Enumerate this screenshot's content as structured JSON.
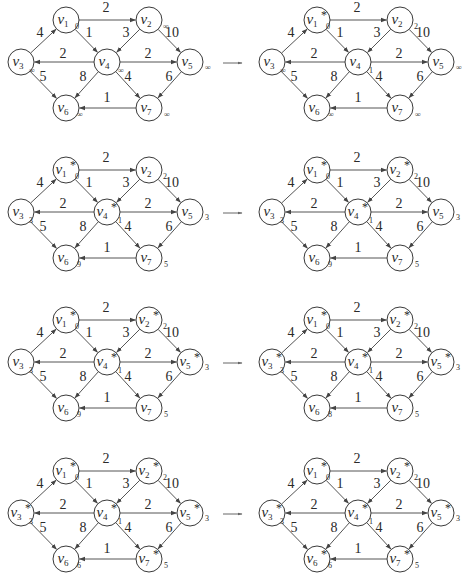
{
  "diagram": {
    "node_radius": 13,
    "nodes": [
      {
        "id": "v1",
        "name": "v",
        "sub": "1",
        "x": 66,
        "y": 20
      },
      {
        "id": "v2",
        "name": "v",
        "sub": "2",
        "x": 149,
        "y": 20
      },
      {
        "id": "v3",
        "name": "v",
        "sub": "3",
        "x": 21,
        "y": 62
      },
      {
        "id": "v4",
        "name": "v",
        "sub": "4",
        "x": 107,
        "y": 62
      },
      {
        "id": "v5",
        "name": "v",
        "sub": "5",
        "x": 190,
        "y": 62
      },
      {
        "id": "v6",
        "name": "v",
        "sub": "6",
        "x": 66,
        "y": 108
      },
      {
        "id": "v7",
        "name": "v",
        "sub": "7",
        "x": 149,
        "y": 108
      }
    ],
    "edges": [
      {
        "from": "v1",
        "to": "v2",
        "weight": "2",
        "lx": 106,
        "ly": 12
      },
      {
        "from": "v1",
        "to": "v4",
        "weight": "1",
        "lx": 89,
        "ly": 37
      },
      {
        "from": "v3",
        "to": "v1",
        "weight": "4",
        "lx": 40,
        "ly": 37
      },
      {
        "from": "v2",
        "to": "v4",
        "weight": "3",
        "lx": 126,
        "ly": 37
      },
      {
        "from": "v2",
        "to": "v5",
        "weight": "10",
        "lx": 172,
        "ly": 37
      },
      {
        "from": "v4",
        "to": "v3",
        "weight": "2",
        "lx": 63,
        "ly": 58
      },
      {
        "from": "v4",
        "to": "v5",
        "weight": "2",
        "lx": 148,
        "ly": 58
      },
      {
        "from": "v3",
        "to": "v6",
        "weight": "5",
        "lx": 43,
        "ly": 81
      },
      {
        "from": "v4",
        "to": "v6",
        "weight": "8",
        "lx": 83,
        "ly": 81
      },
      {
        "from": "v4",
        "to": "v7",
        "weight": "4",
        "lx": 128,
        "ly": 81
      },
      {
        "from": "v5",
        "to": "v7",
        "weight": "6",
        "lx": 169,
        "ly": 81
      },
      {
        "from": "v7",
        "to": "v6",
        "weight": "1",
        "lx": 107,
        "ly": 102
      }
    ],
    "step_arrow": {
      "x1": 223,
      "y1": 63,
      "x2": 242,
      "y2": 63
    },
    "panel_offset_x": 251,
    "row_offsets_y": [
      0,
      150,
      300,
      451
    ]
  },
  "panels": [
    {
      "row": 0,
      "col": 0,
      "labels": {
        "v1": "0",
        "v2": "∞",
        "v3": "∞",
        "v4": "∞",
        "v5": "∞",
        "v6": "∞",
        "v7": "∞"
      },
      "starred": []
    },
    {
      "row": 0,
      "col": 1,
      "labels": {
        "v1": "0",
        "v2": "2",
        "v3": "∞",
        "v4": "1",
        "v5": "∞",
        "v6": "∞",
        "v7": "∞"
      },
      "starred": [
        "v1"
      ]
    },
    {
      "row": 1,
      "col": 0,
      "labels": {
        "v1": "0",
        "v2": "2",
        "v3": "3",
        "v4": "1",
        "v5": "3",
        "v6": "9",
        "v7": "5"
      },
      "starred": [
        "v1",
        "v4"
      ]
    },
    {
      "row": 1,
      "col": 1,
      "labels": {
        "v1": "0",
        "v2": "2",
        "v3": "3",
        "v4": "1",
        "v5": "3",
        "v6": "9",
        "v7": "5"
      },
      "starred": [
        "v1",
        "v2",
        "v4"
      ]
    },
    {
      "row": 2,
      "col": 0,
      "labels": {
        "v1": "0",
        "v2": "2",
        "v3": "3",
        "v4": "1",
        "v5": "3",
        "v6": "9",
        "v7": "5"
      },
      "starred": [
        "v1",
        "v2",
        "v4",
        "v5"
      ]
    },
    {
      "row": 2,
      "col": 1,
      "labels": {
        "v1": "0",
        "v2": "2",
        "v3": "3",
        "v4": "1",
        "v5": "3",
        "v6": "8",
        "v7": "5"
      },
      "starred": [
        "v1",
        "v2",
        "v3",
        "v4",
        "v5"
      ]
    },
    {
      "row": 3,
      "col": 0,
      "labels": {
        "v1": "0",
        "v2": "2",
        "v3": "3",
        "v4": "1",
        "v5": "3",
        "v6": "6",
        "v7": "5"
      },
      "starred": [
        "v1",
        "v2",
        "v3",
        "v4",
        "v5",
        "v7"
      ]
    },
    {
      "row": 3,
      "col": 1,
      "labels": {
        "v1": "0",
        "v2": "2",
        "v3": "3",
        "v4": "1",
        "v5": "3",
        "v6": "6",
        "v7": "5"
      },
      "starred": [
        "v1",
        "v2",
        "v3",
        "v4",
        "v5",
        "v6",
        "v7"
      ]
    }
  ],
  "symbols": {
    "star": "*"
  }
}
